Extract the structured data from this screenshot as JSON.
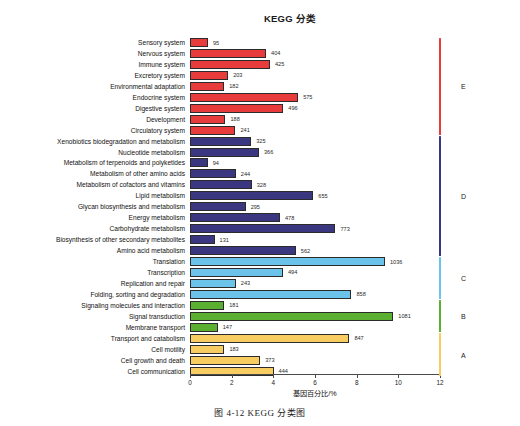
{
  "figure": {
    "title": "KEGG 分类",
    "caption": "图 4-12    KEGG 分类图"
  },
  "chart_data": {
    "type": "bar",
    "orientation": "horizontal",
    "title": "KEGG 分类",
    "xlabel": "基因百分比/%",
    "ylabel": "",
    "xlim": [
      0,
      12
    ],
    "xticks": [
      0,
      2,
      4,
      6,
      8,
      10,
      12
    ],
    "grid": false,
    "legend": "right-brackets",
    "value_unit": "gene count",
    "categories": [
      "Sensory system",
      "Nervous system",
      "Immune system",
      "Excretory system",
      "Environmental adaptation",
      "Endocrine system",
      "Digestive system",
      "Development",
      "Circulatory system",
      "Xenobiotics biodegradation and metabolism",
      "Nucleotide metabolism",
      "Metabolism of terpenoids and polyketides",
      "Metabolism of other amino acids",
      "Metabolism of cofactors and vitamins",
      "Lipid metabolism",
      "Glycan biosynthesis and metabolism",
      "Energy metabolism",
      "Carbohydrate metabolism",
      "Biosynthesis of other secondary metabolites",
      "Amino acid metabolism",
      "Translation",
      "Transcription",
      "Replication and repair",
      "Folding, sorting and degradation",
      "Signaling molecules and interaction",
      "Signal transduction",
      "Membrane transport",
      "Transport and catabolism",
      "Cell motility",
      "Cell growth and death",
      "Cell communication"
    ],
    "values": [
      95,
      404,
      425,
      203,
      182,
      575,
      496,
      188,
      241,
      325,
      366,
      94,
      244,
      328,
      655,
      295,
      478,
      773,
      131,
      562,
      1036,
      494,
      243,
      858,
      181,
      1081,
      147,
      847,
      183,
      373,
      444
    ],
    "percents": [
      0.86,
      3.65,
      3.84,
      1.83,
      1.64,
      5.19,
      4.48,
      1.7,
      2.18,
      2.94,
      3.31,
      0.85,
      2.2,
      2.96,
      5.92,
      2.67,
      4.32,
      6.98,
      1.18,
      5.08,
      9.36,
      4.46,
      2.2,
      7.75,
      1.64,
      9.76,
      1.33,
      7.65,
      1.65,
      3.37,
      4.01
    ],
    "groups": [
      {
        "letter": "E",
        "color": "#e83b3b",
        "start_index": 0,
        "end_index": 8
      },
      {
        "letter": "D",
        "color": "#3a3780",
        "start_index": 9,
        "end_index": 19
      },
      {
        "letter": "C",
        "color": "#6cc3ea",
        "start_index": 20,
        "end_index": 23
      },
      {
        "letter": "B",
        "color": "#5bb031",
        "start_index": 24,
        "end_index": 26
      },
      {
        "letter": "A",
        "color": "#f7cd62",
        "start_index": 27,
        "end_index": 30
      }
    ]
  }
}
